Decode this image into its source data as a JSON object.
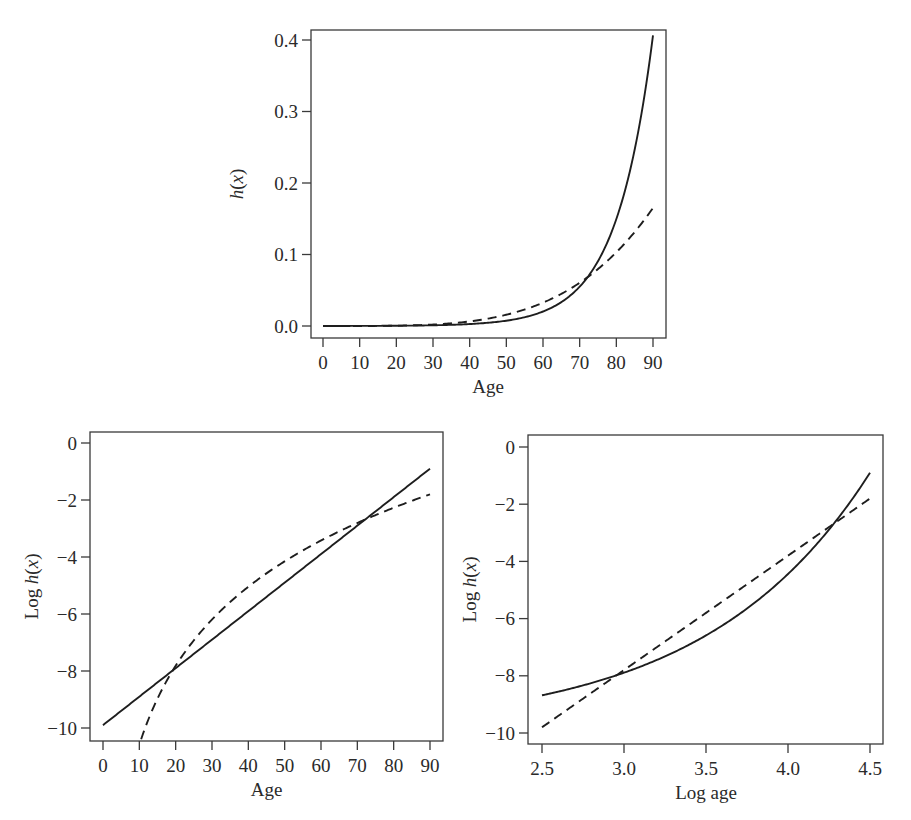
{
  "chart_data": [
    {
      "id": "hazard",
      "type": "line",
      "title": "",
      "xlabel": "Age",
      "ylabel": "h(x)",
      "ylabel_parts": {
        "pre": "",
        "italic": "h",
        "post": "(",
        "var": "x",
        "close": ")"
      },
      "xlim": [
        0,
        90
      ],
      "ylim": [
        0.0,
        0.4
      ],
      "xticks": [
        0,
        10,
        20,
        30,
        40,
        50,
        60,
        70,
        80,
        90
      ],
      "xtick_labels": [
        "0",
        "10",
        "20",
        "30",
        "40",
        "50",
        "60",
        "70",
        "80",
        "90"
      ],
      "yticks": [
        0.0,
        0.1,
        0.2,
        0.3,
        0.4
      ],
      "ytick_labels": [
        "0.0",
        "0.1",
        "0.2",
        "0.3",
        "0.4"
      ],
      "grid": false,
      "legend": null,
      "frame": {
        "left": 311,
        "top": 30,
        "right": 666,
        "bottom": 338
      },
      "xmap": {
        "v0": 0,
        "p0": 323,
        "v1": 90,
        "p1": 653
      },
      "ymap": {
        "v0": 0.0,
        "p0": 326,
        "v1": 0.4,
        "p1": 40
      },
      "x_domain": "age",
      "y_transform": "exp",
      "series": [
        {
          "name": "Gompertz (solid)",
          "style": "solid",
          "model": "gompertz",
          "x": [
            0,
            10,
            20,
            30,
            40,
            50,
            60,
            70,
            80,
            90
          ],
          "values": [
            5e-05,
            0.00014,
            0.00037,
            0.001,
            0.0027,
            0.0074,
            0.0202,
            0.055,
            0.1496,
            0.4066
          ]
        },
        {
          "name": "Weibull (dashed)",
          "style": "dashed",
          "model": "weibull",
          "x": [
            0,
            10,
            20,
            30,
            40,
            50,
            60,
            70,
            80,
            90
          ],
          "values": [
            0.0,
            3e-05,
            0.0004,
            0.002,
            0.0064,
            0.0156,
            0.0323,
            0.0599,
            0.1022,
            0.1637
          ]
        }
      ]
    },
    {
      "id": "log-hazard-age",
      "type": "line",
      "title": "",
      "xlabel": "Age",
      "ylabel": "Log h(x)",
      "ylabel_parts": {
        "pre": "Log ",
        "italic": "h",
        "post": "(",
        "var": "x",
        "close": ")"
      },
      "xlim": [
        0,
        90
      ],
      "ylim": [
        -10.4,
        0.3
      ],
      "xticks": [
        0,
        10,
        20,
        30,
        40,
        50,
        60,
        70,
        80,
        90
      ],
      "xtick_labels": [
        "0",
        "10",
        "20",
        "30",
        "40",
        "50",
        "60",
        "70",
        "80",
        "90"
      ],
      "yticks": [
        0,
        -2,
        -4,
        -6,
        -8,
        -10
      ],
      "ytick_labels": [
        "0",
        "−2",
        "−4",
        "−6",
        "−8",
        "−10"
      ],
      "grid": false,
      "legend": null,
      "frame": {
        "left": 90,
        "top": 432,
        "right": 443,
        "bottom": 741
      },
      "xmap": {
        "v0": 0,
        "p0": 103,
        "v1": 90,
        "p1": 430
      },
      "ymap": {
        "v0": 0,
        "p0": 443,
        "v1": -10,
        "p1": 728
      },
      "x_domain": "age",
      "y_transform": "none",
      "series": [
        {
          "name": "Gompertz (solid)",
          "style": "solid",
          "model": "gompertz",
          "x": [
            0,
            10,
            20,
            30,
            40,
            50,
            60,
            70,
            80,
            90
          ],
          "values": [
            -9.9,
            -8.9,
            -7.9,
            -6.9,
            -5.9,
            -4.9,
            -3.9,
            -2.9,
            -1.9,
            -0.9
          ]
        },
        {
          "name": "Weibull (dashed)",
          "style": "dashed",
          "model": "weibull",
          "x": [
            10.5,
            20,
            30,
            40,
            50,
            60,
            70,
            80,
            90
          ],
          "values": [
            -10.4,
            -7.82,
            -6.2,
            -5.04,
            -4.15,
            -3.42,
            -2.81,
            -2.27,
            -1.8
          ]
        }
      ]
    },
    {
      "id": "log-hazard-log-age",
      "type": "line",
      "title": "",
      "xlabel": "Log age",
      "ylabel": "Log h(x)",
      "ylabel_parts": {
        "pre": "Log ",
        "italic": "h",
        "post": "(",
        "var": "x",
        "close": ")"
      },
      "xlim": [
        2.42,
        4.58
      ],
      "ylim": [
        -10.4,
        0.3
      ],
      "xticks": [
        2.5,
        3.0,
        3.5,
        4.0,
        4.5
      ],
      "xtick_labels": [
        "2.5",
        "3.0",
        "3.5",
        "4.0",
        "4.5"
      ],
      "yticks": [
        0,
        -2,
        -4,
        -6,
        -8,
        -10
      ],
      "ytick_labels": [
        "0",
        "−2",
        "−4",
        "−6",
        "−8",
        "−10"
      ],
      "grid": false,
      "legend": null,
      "frame": {
        "left": 528,
        "top": 435,
        "right": 883,
        "bottom": 744
      },
      "xmap": {
        "v0": 2.5,
        "p0": 542,
        "v1": 4.5,
        "p1": 870
      },
      "ymap": {
        "v0": 0,
        "p0": 447,
        "v1": -10,
        "p1": 733
      },
      "x_domain": "logage",
      "y_transform": "none",
      "series": [
        {
          "name": "Gompertz (solid)",
          "style": "solid",
          "model": "gompertz",
          "x": [
            2.5,
            3.0,
            3.5,
            4.0,
            4.5
          ],
          "values": [
            -8.68,
            -7.89,
            -6.59,
            -4.44,
            -0.9
          ]
        },
        {
          "name": "Weibull (dashed)",
          "style": "dashed",
          "model": "weibull",
          "x": [
            2.5,
            3.0,
            3.5,
            4.0,
            4.5
          ],
          "values": [
            -9.8,
            -7.8,
            -5.8,
            -3.8,
            -1.8
          ]
        }
      ]
    }
  ],
  "models": {
    "gompertz": {
      "intercept": -9.9,
      "slope_per_year": 0.1
    },
    "weibull": {
      "intercept": -19.8,
      "slope_per_log_year": 4.0
    }
  }
}
